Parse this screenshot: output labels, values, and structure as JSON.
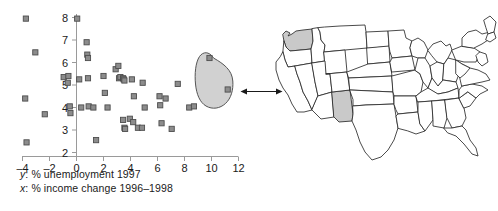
{
  "figure": {
    "width": 498,
    "height": 211,
    "background": "#ffffff"
  },
  "captions": {
    "y_axis_var": "y",
    "y_axis_text": ": % unemployment 1997",
    "x_axis_var": "x",
    "x_axis_text": ": % income change 1996–1998"
  },
  "colors": {
    "marker_fill": "#8c8c8c",
    "marker_stroke": "#4d4d4d",
    "axis": "#9a9a9a",
    "tick_text": "#1a1a1a",
    "lasso_fill": "#c9c9c9",
    "lasso_stroke": "#555555",
    "map_stroke": "#2b2b2b",
    "map_fill": "#ffffff",
    "state_highlight_fill": "#c9c9c9",
    "arrow": "#1a1a1a"
  },
  "chart_data": {
    "type": "scatter",
    "title": "",
    "xlabel": "x: % income change 1996–1998",
    "ylabel": "y: % unemployment 1997",
    "xlim": [
      -4,
      12
    ],
    "ylim": [
      2,
      8
    ],
    "xticks": [
      -4,
      -2,
      0,
      2,
      4,
      6,
      8,
      10,
      12
    ],
    "yticks": [
      2,
      3,
      4,
      5,
      6,
      7,
      8
    ],
    "xtick_labels": [
      "–4",
      "–2",
      "0",
      "2",
      "4",
      "6",
      "8",
      "10",
      "12"
    ],
    "ytick_labels": [
      "2",
      "3",
      "4",
      "5",
      "6",
      "7",
      "8"
    ],
    "grid": false,
    "legend": false,
    "marker": "square",
    "points": [
      [
        -3.75,
        7.95
      ],
      [
        -3.05,
        6.45
      ],
      [
        -3.8,
        4.4
      ],
      [
        -2.35,
        3.7
      ],
      [
        -3.7,
        2.45
      ],
      [
        -0.95,
        5.35
      ],
      [
        -0.6,
        5.4
      ],
      [
        -0.65,
        5.1
      ],
      [
        -0.5,
        4.05
      ],
      [
        -0.45,
        3.75
      ],
      [
        0.05,
        7.95
      ],
      [
        0.2,
        5.25
      ],
      [
        0.35,
        4.0
      ],
      [
        0.75,
        6.9
      ],
      [
        0.8,
        6.35
      ],
      [
        0.85,
        6.2
      ],
      [
        0.85,
        5.3
      ],
      [
        0.9,
        4.05
      ],
      [
        1.25,
        4.0
      ],
      [
        1.45,
        2.55
      ],
      [
        2.0,
        5.4
      ],
      [
        2.1,
        4.65
      ],
      [
        2.3,
        4.0
      ],
      [
        2.9,
        5.7
      ],
      [
        3.1,
        5.85
      ],
      [
        3.15,
        5.3
      ],
      [
        3.25,
        5.35
      ],
      [
        3.45,
        5.3
      ],
      [
        3.5,
        5.25
      ],
      [
        3.55,
        5.2
      ],
      [
        3.45,
        3.45
      ],
      [
        3.55,
        3.1
      ],
      [
        3.6,
        3.05
      ],
      [
        3.95,
        3.5
      ],
      [
        4.1,
        5.25
      ],
      [
        4.25,
        4.5
      ],
      [
        4.2,
        3.35
      ],
      [
        4.55,
        3.1
      ],
      [
        4.85,
        3.1
      ],
      [
        4.9,
        5.1
      ],
      [
        5.05,
        4.0
      ],
      [
        6.15,
        4.5
      ],
      [
        6.2,
        4.1
      ],
      [
        6.3,
        3.3
      ],
      [
        6.6,
        4.4
      ],
      [
        7.05,
        3.05
      ],
      [
        7.5,
        5.05
      ],
      [
        8.35,
        4.0
      ],
      [
        8.7,
        4.05
      ],
      [
        9.85,
        6.2
      ],
      [
        11.2,
        4.8
      ]
    ],
    "annotations": {
      "lasso": {
        "label": "selection-lasso",
        "shape": "teardrop",
        "enclosed_points": [
          [
            9.85,
            6.2
          ],
          [
            11.2,
            4.8
          ]
        ]
      },
      "connector": {
        "label": "double-headed-arrow",
        "from": "lasso",
        "to": "map"
      }
    }
  },
  "map": {
    "label": "United States state map",
    "highlighted_states": [
      "Washington",
      "New Mexico"
    ]
  }
}
